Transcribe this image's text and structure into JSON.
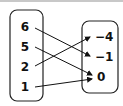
{
  "diagram": {
    "type": "mapping",
    "domain": {
      "values": [
        "6",
        "5",
        "2",
        "1"
      ]
    },
    "range": {
      "values": [
        "−4",
        "−1",
        "0"
      ]
    },
    "arrows": [
      {
        "from": "6",
        "to": "−1"
      },
      {
        "from": "5",
        "to": "0"
      },
      {
        "from": "2",
        "to": "−4"
      },
      {
        "from": "1",
        "to": "0"
      }
    ]
  }
}
